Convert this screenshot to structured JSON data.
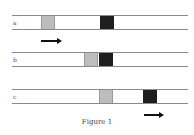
{
  "figure": {
    "caption": "Figure 1",
    "colors": {
      "line": "#8a8a8a",
      "gray_box": "#bdbdbd",
      "black_box": "#1e1e1e",
      "arrow": "#111111"
    },
    "rows": [
      {
        "label": "a",
        "gray_box_x": 29,
        "black_box_x": 88,
        "arrow": {
          "position": "below",
          "direction": "right",
          "x": 29,
          "width": 21
        }
      },
      {
        "label": "b",
        "gray_box_x": 72,
        "black_box_x": 87
      },
      {
        "label": "c",
        "gray_box_x": 87,
        "black_box_x": 131,
        "arrow": {
          "position": "below",
          "direction": "right",
          "x": 132,
          "width": 20
        }
      }
    ]
  }
}
